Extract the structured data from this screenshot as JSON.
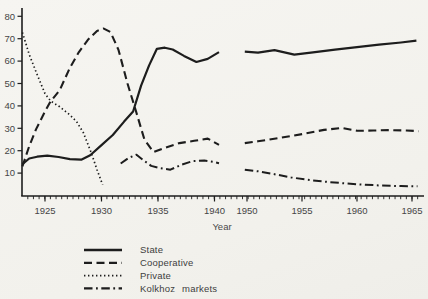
{
  "figure": {
    "background": "#f5f4f0",
    "ink": "#1d1d1d",
    "text_color": "#454545"
  },
  "chart_data": {
    "type": "line",
    "title": "",
    "xlabel": "Year",
    "ylabel": "",
    "grid": false,
    "legend_position": "bottom-left",
    "ylim": [
      0,
      84
    ],
    "y_ticks": [
      10,
      20,
      30,
      40,
      50,
      60,
      70,
      80
    ],
    "x_tick_years": [
      1925,
      1930,
      1935,
      1940,
      1950,
      1955,
      1960,
      1965
    ],
    "x_axis_note": "time axis compressed between 1940 and 1950; all series have a gap there",
    "units": "percent share",
    "series": [
      {
        "name": "State",
        "style": "solid",
        "segments": [
          [
            [
              1923,
              14
            ],
            [
              1923.6,
              16.5
            ],
            [
              1924.3,
              17.3
            ],
            [
              1925.2,
              17.8
            ],
            [
              1926.2,
              17.2
            ],
            [
              1927.2,
              16.2
            ],
            [
              1928.2,
              16
            ],
            [
              1929,
              18
            ],
            [
              1930,
              22.5
            ],
            [
              1931,
              27
            ],
            [
              1932,
              33
            ],
            [
              1932.8,
              37.5
            ],
            [
              1933.5,
              49
            ],
            [
              1934.2,
              58
            ],
            [
              1934.9,
              65.5
            ],
            [
              1935.6,
              66
            ],
            [
              1936.3,
              65.2
            ],
            [
              1937.3,
              62.3
            ],
            [
              1938.4,
              59.6
            ],
            [
              1939.4,
              61
            ],
            [
              1940.4,
              64
            ]
          ],
          [
            [
              1949.8,
              64.2
            ],
            [
              1951,
              63.8
            ],
            [
              1952.5,
              64.9
            ],
            [
              1954.3,
              62.9
            ],
            [
              1956,
              63.9
            ],
            [
              1958,
              65.1
            ],
            [
              1960,
              66.2
            ],
            [
              1962,
              67.3
            ],
            [
              1964,
              68.3
            ],
            [
              1965.4,
              69.1
            ]
          ]
        ]
      },
      {
        "name": "Cooperative",
        "style": "dashed",
        "segments": [
          [
            [
              1923,
              13
            ],
            [
              1923.6,
              22
            ],
            [
              1924.2,
              29.5
            ],
            [
              1925,
              37.5
            ],
            [
              1925.5,
              42
            ],
            [
              1926.3,
              47
            ],
            [
              1927.2,
              57
            ],
            [
              1928,
              64
            ],
            [
              1928.8,
              69.5
            ],
            [
              1929.6,
              73.5
            ],
            [
              1930.2,
              74.5
            ],
            [
              1930.8,
              73
            ],
            [
              1931.5,
              65
            ],
            [
              1932.3,
              50
            ],
            [
              1933,
              38.5
            ],
            [
              1933.8,
              25
            ],
            [
              1934.6,
              19.4
            ],
            [
              1935.6,
              21.3
            ],
            [
              1936.9,
              23.4
            ],
            [
              1938.2,
              24.4
            ],
            [
              1939.4,
              25.4
            ],
            [
              1940.4,
              22.6
            ]
          ],
          [
            [
              1949.8,
              23.4
            ],
            [
              1951,
              24.2
            ],
            [
              1953,
              25.7
            ],
            [
              1955,
              27.4
            ],
            [
              1957,
              29.3
            ],
            [
              1958.6,
              30.2
            ],
            [
              1960,
              28.9
            ],
            [
              1961.5,
              29
            ],
            [
              1963,
              29.2
            ],
            [
              1964.5,
              29
            ],
            [
              1965.6,
              28.7
            ]
          ]
        ]
      },
      {
        "name": "Private",
        "style": "dotted",
        "segments": [
          [
            [
              1923,
              72.8
            ],
            [
              1923.6,
              63
            ],
            [
              1924.3,
              54
            ],
            [
              1925,
              45.5
            ],
            [
              1925.5,
              42.2
            ],
            [
              1926.3,
              39.6
            ],
            [
              1927.2,
              36
            ],
            [
              1927.8,
              33
            ],
            [
              1928.4,
              28
            ],
            [
              1929.1,
              19
            ],
            [
              1929.6,
              11.5
            ],
            [
              1930.1,
              4.8
            ]
          ]
        ]
      },
      {
        "name": "Kolkhoz markets",
        "style": "dashdot",
        "segments": [
          [
            [
              1931.7,
              14.3
            ],
            [
              1932.4,
              16.8
            ],
            [
              1933.1,
              18.2
            ],
            [
              1933.7,
              15.8
            ],
            [
              1934.4,
              13.2
            ],
            [
              1935.2,
              12.2
            ],
            [
              1936.1,
              11.5
            ],
            [
              1937.1,
              13.8
            ],
            [
              1938.1,
              15.4
            ],
            [
              1939.1,
              15.6
            ],
            [
              1939.9,
              15
            ],
            [
              1940.4,
              14.4
            ]
          ],
          [
            [
              1949.8,
              11.5
            ],
            [
              1951,
              10.8
            ],
            [
              1952.5,
              9.5
            ],
            [
              1954,
              8.1
            ],
            [
              1955.5,
              7
            ],
            [
              1957,
              6.2
            ],
            [
              1958.5,
              5.6
            ],
            [
              1960,
              5
            ],
            [
              1962,
              4.5
            ],
            [
              1964,
              4.2
            ],
            [
              1965.5,
              4.1
            ]
          ]
        ]
      }
    ]
  },
  "legend": {
    "items": [
      {
        "label": "State",
        "style": "solid"
      },
      {
        "label": "Cooperative",
        "style": "dashed"
      },
      {
        "label": "Private",
        "style": "dotted"
      },
      {
        "label": "Kolkhoz markets",
        "style": "dashdot"
      }
    ]
  },
  "axis_labels": {
    "x_title": "Year"
  }
}
